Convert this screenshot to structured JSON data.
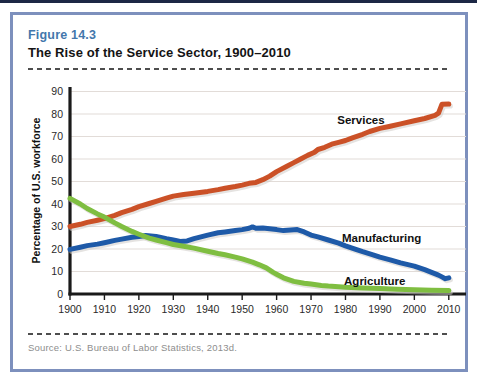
{
  "page": {
    "figure_label": "Figure 14.3",
    "figure_title": "The Rise of the Service Sector, 1900–2010",
    "source": "Source: U.S. Bureau of Labor Statistics, 2013d."
  },
  "colors": {
    "figure_label_blue": "#4377ac",
    "frame_border": "#7d90bd",
    "top_bar_navy": "#1c2845",
    "grid": "#e2dcd8",
    "axis": "#1a1a1a",
    "line_shadow": "#cfccc8",
    "tick_text": "#2a2a2a",
    "annotation_text": "#111111"
  },
  "chart_data": {
    "type": "line",
    "title": "",
    "xlabel": "",
    "ylabel": "Percentage of U.S. workforce",
    "xlim": [
      1900,
      2015
    ],
    "ylim": [
      0,
      92
    ],
    "x_ticks": [
      1900,
      1910,
      1920,
      1930,
      1940,
      1950,
      1960,
      1970,
      1980,
      1990,
      2000,
      2010
    ],
    "y_ticks": [
      0,
      10,
      20,
      30,
      40,
      50,
      60,
      70,
      80,
      90
    ],
    "grid": "horizontal",
    "legend": "inline-labels",
    "series": [
      {
        "name": "Services",
        "color": "#cb5127",
        "z": 2,
        "label_at": {
          "x": 1984.5,
          "y": 77.5
        },
        "points": [
          [
            1900,
            30
          ],
          [
            1903,
            31
          ],
          [
            1905,
            31.8
          ],
          [
            1908,
            32.8
          ],
          [
            1910,
            33.5
          ],
          [
            1913,
            35
          ],
          [
            1915,
            36.2
          ],
          [
            1918,
            37.6
          ],
          [
            1920,
            38.8
          ],
          [
            1923,
            40.2
          ],
          [
            1925,
            41.2
          ],
          [
            1928,
            42.6
          ],
          [
            1930,
            43.5
          ],
          [
            1933,
            44.2
          ],
          [
            1936,
            44.8
          ],
          [
            1940,
            45.6
          ],
          [
            1943,
            46.4
          ],
          [
            1945,
            47
          ],
          [
            1948,
            47.8
          ],
          [
            1950,
            48.4
          ],
          [
            1952,
            49.2
          ],
          [
            1954,
            49.6
          ],
          [
            1956,
            50.8
          ],
          [
            1958,
            52.4
          ],
          [
            1960,
            54.4
          ],
          [
            1963,
            56.8
          ],
          [
            1965,
            58.4
          ],
          [
            1967,
            60
          ],
          [
            1969,
            61.6
          ],
          [
            1971,
            63
          ],
          [
            1972,
            64.2
          ],
          [
            1974,
            65.2
          ],
          [
            1976,
            66.6
          ],
          [
            1978,
            67.4
          ],
          [
            1980,
            68.2
          ],
          [
            1982,
            69.4
          ],
          [
            1985,
            71
          ],
          [
            1987,
            72.2
          ],
          [
            1990,
            73.6
          ],
          [
            1993,
            74.6
          ],
          [
            1996,
            75.6
          ],
          [
            2000,
            77
          ],
          [
            2003,
            78
          ],
          [
            2006,
            79.4
          ],
          [
            2007,
            80.4
          ],
          [
            2008,
            84.3
          ],
          [
            2010,
            84.4
          ]
        ]
      },
      {
        "name": "Manufacturing",
        "color": "#1e5aa8",
        "z": 1,
        "label_at": {
          "x": 1990.5,
          "y": 24.8
        },
        "points": [
          [
            1900,
            19.8
          ],
          [
            1903,
            20.8
          ],
          [
            1905,
            21.5
          ],
          [
            1908,
            22.2
          ],
          [
            1910,
            22.8
          ],
          [
            1913,
            23.8
          ],
          [
            1915,
            24.4
          ],
          [
            1918,
            25.2
          ],
          [
            1920,
            25.6
          ],
          [
            1922,
            26
          ],
          [
            1925,
            25.6
          ],
          [
            1928,
            24.6
          ],
          [
            1930,
            24
          ],
          [
            1932,
            23.4
          ],
          [
            1934,
            23.6
          ],
          [
            1936,
            24.6
          ],
          [
            1938,
            25.4
          ],
          [
            1940,
            26.2
          ],
          [
            1943,
            27.2
          ],
          [
            1945,
            27.6
          ],
          [
            1948,
            28.2
          ],
          [
            1950,
            28.6
          ],
          [
            1952,
            29.2
          ],
          [
            1953,
            29.8
          ],
          [
            1954,
            29.2
          ],
          [
            1956,
            29.4
          ],
          [
            1958,
            29
          ],
          [
            1960,
            28.6
          ],
          [
            1962,
            28.2
          ],
          [
            1964,
            28.4
          ],
          [
            1966,
            28.6
          ],
          [
            1968,
            27.6
          ],
          [
            1970,
            26.2
          ],
          [
            1972,
            25.4
          ],
          [
            1975,
            24
          ],
          [
            1978,
            22.6
          ],
          [
            1980,
            21.4
          ],
          [
            1983,
            19.8
          ],
          [
            1985,
            18.8
          ],
          [
            1988,
            17.4
          ],
          [
            1990,
            16.4
          ],
          [
            1993,
            15.2
          ],
          [
            1996,
            13.8
          ],
          [
            2000,
            12.4
          ],
          [
            2003,
            10.8
          ],
          [
            2005,
            9.6
          ],
          [
            2007,
            8.4
          ],
          [
            2008,
            7.6
          ],
          [
            2009,
            6.8
          ],
          [
            2010,
            7.2
          ]
        ]
      },
      {
        "name": "Agriculture",
        "color": "#7fbe41",
        "z": 3,
        "label_at": {
          "x": 1988.5,
          "y": 5.8
        },
        "points": [
          [
            1900,
            42.5
          ],
          [
            1903,
            40
          ],
          [
            1905,
            38
          ],
          [
            1908,
            35.6
          ],
          [
            1910,
            34.2
          ],
          [
            1913,
            31.6
          ],
          [
            1915,
            30
          ],
          [
            1918,
            27.8
          ],
          [
            1920,
            26.6
          ],
          [
            1923,
            24.8
          ],
          [
            1925,
            24
          ],
          [
            1928,
            22.8
          ],
          [
            1930,
            22
          ],
          [
            1933,
            21.2
          ],
          [
            1936,
            20.4
          ],
          [
            1940,
            19
          ],
          [
            1943,
            18
          ],
          [
            1945,
            17.4
          ],
          [
            1948,
            16.4
          ],
          [
            1950,
            15.6
          ],
          [
            1953,
            14.2
          ],
          [
            1955,
            13
          ],
          [
            1957,
            11.6
          ],
          [
            1959,
            9.6
          ],
          [
            1960,
            8.8
          ],
          [
            1962,
            7.2
          ],
          [
            1965,
            5.6
          ],
          [
            1968,
            4.8
          ],
          [
            1970,
            4.4
          ],
          [
            1973,
            3.8
          ],
          [
            1975,
            3.5
          ],
          [
            1980,
            3
          ],
          [
            1985,
            2.7
          ],
          [
            1990,
            2.4
          ],
          [
            1995,
            2.1
          ],
          [
            2000,
            1.9
          ],
          [
            2005,
            1.7
          ],
          [
            2010,
            1.5
          ]
        ]
      }
    ]
  }
}
